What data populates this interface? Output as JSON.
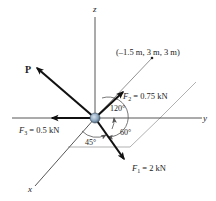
{
  "diagram": {
    "type": "3d-force-system",
    "axes": {
      "x_label": "x",
      "y_label": "y",
      "z_label": "z"
    },
    "forces": [
      {
        "id": "P",
        "label": "P",
        "magnitude": "",
        "direction": "unknown"
      },
      {
        "id": "F1",
        "symbol": "F",
        "subscript": "1",
        "value": " = 2 kN",
        "label": "F1 = 2 kN"
      },
      {
        "id": "F2",
        "symbol": "F",
        "subscript": "2",
        "value": " = 0.75 kN",
        "label": "F2 = 0.75 kN"
      },
      {
        "id": "F3",
        "symbol": "F",
        "subscript": "3",
        "value": " = 0.5 kN",
        "label": "F3 = 0.5 kN"
      }
    ],
    "point": {
      "label": "(–1.5 m, 3 m, 3 m)"
    },
    "angles": [
      {
        "id": "a120",
        "label": "120°"
      },
      {
        "id": "a60",
        "label": "60°"
      },
      {
        "id": "a45",
        "label": "45°"
      }
    ],
    "colors": {
      "force_arrow": "#111111",
      "axis_line": "#444444",
      "guide_line": "#a8a8a8",
      "particle_fill": "#8fa8bf",
      "particle_edge": "#35485a",
      "text": "#222222"
    }
  }
}
